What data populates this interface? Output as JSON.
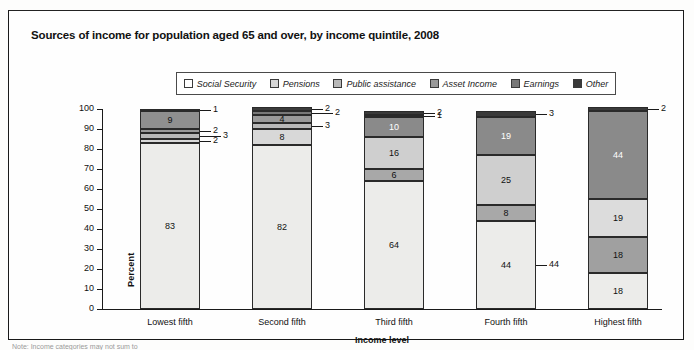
{
  "title": "Sources of income for population aged 65 and over, by income quintile, 2008",
  "footnote": "Note: Income categories may not sum to",
  "legend": {
    "items": [
      {
        "label": "Social Security",
        "color": "#ffffff"
      },
      {
        "label": "Pensions",
        "color": "#d8d8d8"
      },
      {
        "label": "Public assistance",
        "color": "#b9b9b9"
      },
      {
        "label": "Asset Income",
        "color": "#9a9a9a"
      },
      {
        "label": "Earnings",
        "color": "#787878"
      },
      {
        "label": "Other",
        "color": "#3a3a3a"
      }
    ]
  },
  "axes": {
    "ylabel": "Percent",
    "xlabel": "Income level",
    "yticks": [
      "100",
      "90",
      "80",
      "70",
      "60",
      "50",
      "40",
      "30",
      "20",
      "10",
      "0"
    ]
  },
  "chart_data": {
    "type": "bar",
    "title": "Sources of income for population aged 65 and over, by income quintile, 2008",
    "xlabel": "Income level",
    "ylabel": "Percent",
    "ylim": [
      0,
      100
    ],
    "grid": false,
    "stacked": true,
    "legend_position": "top",
    "categories": [
      "Lowest fifth",
      "Second fifth",
      "Third fifth",
      "Fourth fifth",
      "Highest fifth"
    ],
    "series": [
      {
        "name": "Social Security",
        "color": "#ffffff",
        "values": [
          83,
          82,
          64,
          44,
          18
        ]
      },
      {
        "name": "Pensions",
        "color": "#d8d8d8",
        "values": [
          2,
          8,
          6,
          8,
          18
        ]
      },
      {
        "name": "Public assistance",
        "color": "#b9b9b9",
        "values": [
          3,
          3,
          1,
          0,
          0
        ]
      },
      {
        "name": "Asset Income",
        "color": "#9a9a9a",
        "values": [
          2,
          4,
          16,
          25,
          19
        ]
      },
      {
        "name": "Earnings",
        "color": "#787878",
        "values": [
          9,
          2,
          10,
          19,
          44
        ]
      },
      {
        "name": "Other",
        "color": "#3a3a3a",
        "values": [
          1,
          2,
          2,
          3,
          2
        ]
      }
    ]
  },
  "bars": [
    {
      "category": "Lowest fifth",
      "segments": [
        {
          "series": "Social Security",
          "value": 83,
          "label": "83",
          "inside": true,
          "color": "#ececea",
          "text": "#111111"
        },
        {
          "series": "Pensions",
          "value": 2,
          "label": "2",
          "inside": false,
          "color": "#d8d8d8",
          "text": "#111111"
        },
        {
          "series": "Public assistance",
          "value": 3,
          "label": "3",
          "inside": false,
          "color": "#b9b9b9",
          "text": "#111111"
        },
        {
          "series": "Asset Income",
          "value": 2,
          "label": "2",
          "inside": false,
          "color": "#9a9a9a",
          "text": "#111111"
        },
        {
          "series": "Earnings",
          "value": 9,
          "label": "9",
          "inside": true,
          "color": "#8f8f8f",
          "text": "#111111"
        },
        {
          "series": "Other",
          "value": 1,
          "label": "1",
          "inside": false,
          "color": "#3a3a3a",
          "text": "#111111"
        }
      ]
    },
    {
      "category": "Second fifth",
      "segments": [
        {
          "series": "Social Security",
          "value": 82,
          "label": "82",
          "inside": true,
          "color": "#ececea",
          "text": "#111111"
        },
        {
          "series": "Pensions",
          "value": 8,
          "label": "8",
          "inside": true,
          "color": "#d8d8d8",
          "text": "#111111"
        },
        {
          "series": "Public assistance",
          "value": 3,
          "label": "3",
          "inside": false,
          "color": "#b9b9b9",
          "text": "#111111"
        },
        {
          "series": "Asset Income",
          "value": 4,
          "label": "4",
          "inside": true,
          "color": "#9a9a9a",
          "text": "#111111"
        },
        {
          "series": "Earnings",
          "value": 2,
          "label": "2",
          "inside": false,
          "color": "#787878",
          "text": "#111111"
        },
        {
          "series": "Other",
          "value": 2,
          "label": "2",
          "inside": false,
          "color": "#3a3a3a",
          "text": "#111111"
        }
      ]
    },
    {
      "category": "Third fifth",
      "segments": [
        {
          "series": "Social Security",
          "value": 64,
          "label": "64",
          "inside": true,
          "color": "#ececea",
          "text": "#111111"
        },
        {
          "series": "Pensions",
          "value": 6,
          "label": "6",
          "inside": true,
          "color": "#a8a8a8",
          "text": "#111111"
        },
        {
          "series": "Asset Income",
          "value": 16,
          "label": "16",
          "inside": true,
          "color": "#cfcfcf",
          "text": "#111111"
        },
        {
          "series": "Earnings",
          "value": 10,
          "label": "10",
          "inside": true,
          "color": "#8a8a8a",
          "text": "#ffffff"
        },
        {
          "series": "Public assistance",
          "value": 1,
          "label": "1",
          "inside": false,
          "color": "#b9b9b9",
          "text": "#111111"
        },
        {
          "series": "Other",
          "value": 2,
          "label": "2",
          "inside": false,
          "color": "#3a3a3a",
          "text": "#111111"
        }
      ]
    },
    {
      "category": "Fourth fifth",
      "segments": [
        {
          "series": "Social Security",
          "value": 44,
          "label": "44",
          "inside": false,
          "color": "#ececea",
          "text": "#111111"
        },
        {
          "series": "Pensions",
          "value": 8,
          "label": "8",
          "inside": true,
          "color": "#a8a8a8",
          "text": "#111111"
        },
        {
          "series": "Asset Income",
          "value": 25,
          "label": "25",
          "inside": true,
          "color": "#cfcfcf",
          "text": "#111111"
        },
        {
          "series": "Earnings",
          "value": 19,
          "label": "19",
          "inside": true,
          "color": "#8a8a8a",
          "text": "#ffffff"
        },
        {
          "series": "Other",
          "value": 3,
          "label": "3",
          "inside": false,
          "color": "#3a3a3a",
          "text": "#111111"
        }
      ]
    },
    {
      "category": "Highest fifth",
      "segments": [
        {
          "series": "Social Security",
          "value": 18,
          "label": "18",
          "inside": true,
          "color": "#ececea",
          "text": "#111111"
        },
        {
          "series": "Pensions",
          "value": 18,
          "label": "18",
          "inside": true,
          "color": "#a0a0a0",
          "text": "#111111"
        },
        {
          "series": "Asset Income",
          "value": 19,
          "label": "19",
          "inside": true,
          "color": "#dcdcdc",
          "text": "#111111"
        },
        {
          "series": "Earnings",
          "value": 44,
          "label": "44",
          "inside": true,
          "color": "#8a8a8a",
          "text": "#ffffff"
        },
        {
          "series": "Other",
          "value": 2,
          "label": "2",
          "inside": false,
          "color": "#3a3a3a",
          "text": "#111111"
        }
      ]
    }
  ],
  "bar_label_44_lowest": "44"
}
